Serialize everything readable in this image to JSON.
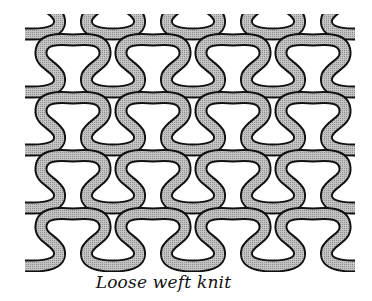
{
  "figure": {
    "caption": "Loose weft knit",
    "rows": 4,
    "stitches_per_row": 4,
    "colors": {
      "yarn_fill": "#b8b8b8",
      "yarn_outline": "#111111",
      "background": "#ffffff"
    },
    "layout": {
      "stitch_spacing_x": 80,
      "row_spacing_y": 58,
      "first_stitch_center_x": 73,
      "first_row_head_top_y": 40,
      "left_end_x": 25,
      "right_end_x": 355,
      "yarn_width": 9
    }
  }
}
